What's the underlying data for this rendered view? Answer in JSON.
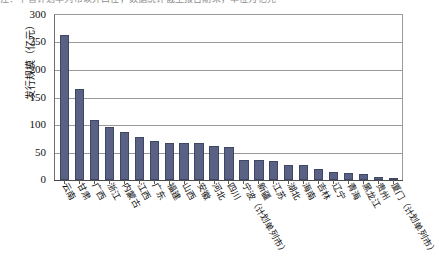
{
  "top_fragment": "注：不含计划单列市以外口径，数据统计截至报告期末，单位为亿元",
  "axis": {
    "y_title": "发行规模（亿元）",
    "y_ticks": [
      "300",
      "250",
      "200",
      "150",
      "100",
      "50",
      "0"
    ]
  },
  "chart_data": {
    "type": "bar",
    "title": "",
    "xlabel": "",
    "ylabel": "发行规模（亿元）",
    "ylim": [
      0,
      300
    ],
    "ytick_step": 50,
    "grid": true,
    "legend": "none",
    "bar_color": "#596285",
    "bar_edge_color": "#3f4763",
    "categories": [
      "云南",
      "甘肃",
      "广西",
      "浙江",
      "内蒙古",
      "江西",
      "广东",
      "福建",
      "山西",
      "安徽",
      "河北",
      "四川",
      "宁波（计划单列市）",
      "新疆",
      "江苏",
      "湖北",
      "海南",
      "吉林",
      "辽宁",
      "青海",
      "黑龙江",
      "贵州",
      "厦门（计划单列市）"
    ],
    "values": [
      262,
      165,
      108,
      95,
      86,
      77,
      70,
      67,
      66,
      66,
      61,
      60,
      37,
      36,
      35,
      28,
      27,
      20,
      14,
      12,
      10,
      6,
      4
    ]
  }
}
